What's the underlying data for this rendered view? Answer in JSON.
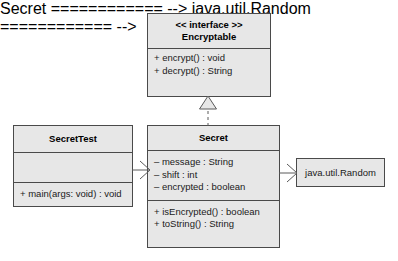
{
  "diagram": {
    "kind": "uml-class-diagram",
    "background_color": "#ffffff",
    "box_fill_color": "#e7e7e7",
    "box_border_color": "#4a4a4a",
    "line_color": "#5a5a5a",
    "text_color": "#1a1a1a"
  },
  "classes": {
    "encryptable": {
      "stereotype": "<< interface >>",
      "name": "Encryptable",
      "attributes": [],
      "methods": [
        "+ encrypt() : void",
        "+ decrypt() : String"
      ]
    },
    "secret_test": {
      "name": "SecretTest",
      "attributes": [],
      "methods": [
        "+ main(args: void) : void"
      ]
    },
    "secret": {
      "name": "Secret",
      "attributes": [
        "– message : String",
        "– shift : int",
        "– encrypted : boolean"
      ],
      "methods": [
        "+ isEncrypted() : boolean",
        "+ toString() : String"
      ]
    },
    "java_util_random": {
      "name": "java.util.Random"
    }
  },
  "relationships": [
    {
      "id": "realization",
      "type": "realization",
      "from": "Secret",
      "to": "Encryptable",
      "line_style": "dashed",
      "arrowhead": "hollow-triangle"
    },
    {
      "id": "uses-secret",
      "type": "association",
      "from": "SecretTest",
      "to": "Secret",
      "line_style": "solid",
      "arrowhead": "open-v"
    },
    {
      "id": "uses-random",
      "type": "association",
      "from": "Secret",
      "to": "java.util.Random",
      "line_style": "solid",
      "arrowhead": "open-v"
    }
  ]
}
